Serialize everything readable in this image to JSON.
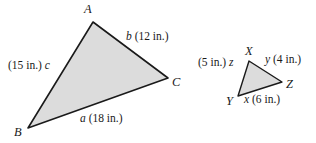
{
  "figure": {
    "background_color": "#ffffff",
    "fill_color": "#dcdcdc",
    "stroke_color": "#1a1a1a"
  },
  "triangle_large": {
    "name": "triangle-abc",
    "vertices": [
      {
        "label": "A",
        "x": 93,
        "y": 22
      },
      {
        "label": "B",
        "x": 28,
        "y": 128
      },
      {
        "label": "C",
        "x": 168,
        "y": 78
      }
    ],
    "vertex_labels": {
      "a_label": "A",
      "b_label": "B",
      "c_label": "C"
    },
    "sides": {
      "side_a": {
        "var": "a",
        "measure": "(18 in.)",
        "full": "a (18 in.)"
      },
      "side_b": {
        "var": "b",
        "measure": "(12 in.)",
        "full": "b (12 in.)"
      },
      "side_c": {
        "var": "c",
        "measure": "(15 in.)",
        "full": "(15 in.) c"
      }
    }
  },
  "triangle_small": {
    "name": "triangle-xyz",
    "vertices": [
      {
        "label": "X",
        "x": 249,
        "y": 61
      },
      {
        "label": "Y",
        "x": 238,
        "y": 96
      },
      {
        "label": "Z",
        "x": 282,
        "y": 82
      }
    ],
    "vertex_labels": {
      "x_label": "X",
      "y_label": "Y",
      "z_label": "Z"
    },
    "sides": {
      "side_x": {
        "var": "x",
        "measure": "(6 in.)",
        "full": "x (6 in.)"
      },
      "side_y": {
        "var": "y",
        "measure": "(4 in.)",
        "full": "y (4 in.)"
      },
      "side_z": {
        "var": "z",
        "measure": "(5 in.)",
        "full": "(5 in.) z"
      }
    }
  },
  "labels": {
    "large_c_measure": "(15 in.)",
    "large_c_var": "c",
    "large_b_var": "b",
    "large_b_measure": "(12 in.)",
    "large_a_var": "a",
    "large_a_measure": "(18 in.)",
    "small_z_measure": "(5 in.)",
    "small_z_var": "z",
    "small_y_var": "y",
    "small_y_measure": "(4 in.)",
    "small_x_var": "x",
    "small_x_measure": "(6 in.)"
  }
}
